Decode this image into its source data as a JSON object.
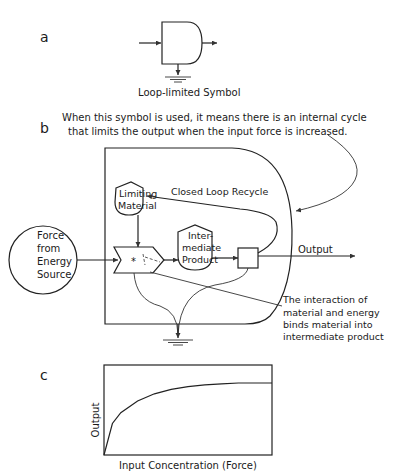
{
  "panels": {
    "a": {
      "label": "a",
      "caption": "Loop-limited  Symbol"
    },
    "b": {
      "label": "b",
      "note_line1": "When this symbol is used, it means there is an internal cycle",
      "note_line2": "that limits the output when the input force is increased.",
      "source": {
        "line1": "Force",
        "line2": "from",
        "line3": "Energy",
        "line4": "Source"
      },
      "limiting_material": {
        "line1": "Limiting",
        "line2": "Material"
      },
      "intermediate_product": {
        "line1": "Inter-",
        "line2": "mediate",
        "line3": "Product"
      },
      "closed_loop_label": "Closed  Loop Recycle",
      "output_label": "Output",
      "interaction_symbol": "*",
      "interaction_note": {
        "line1": "The  interaction  of",
        "line2": "material  and  energy",
        "line3": "binds  material  into",
        "line4": "intermediate   product"
      }
    },
    "c": {
      "label": "c"
    }
  },
  "chart_data": {
    "type": "line",
    "title": "",
    "xlabel": "Input Concentration (Force)",
    "ylabel": "Output",
    "grid": false,
    "legend": "none",
    "series": [
      {
        "name": "Output",
        "shape": "saturating (hyperbolic) curve rising steeply from origin and leveling off",
        "x": [
          0,
          0.05,
          0.1,
          0.2,
          0.3,
          0.4,
          0.5,
          0.6,
          0.7,
          0.8,
          0.9,
          1.0
        ],
        "y": [
          0,
          0.35,
          0.47,
          0.6,
          0.68,
          0.73,
          0.76,
          0.78,
          0.79,
          0.8,
          0.8,
          0.8
        ]
      }
    ],
    "xlim": [
      0,
      1
    ],
    "ylim": [
      0,
      1
    ]
  }
}
